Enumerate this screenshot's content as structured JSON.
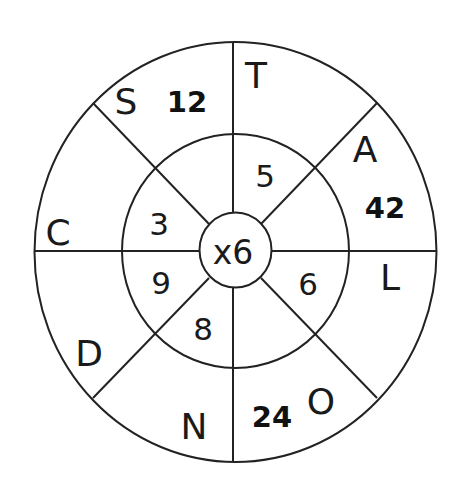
{
  "diagram": {
    "type": "multiplication-wheel",
    "center": {
      "label": "x6",
      "multiplier": 6
    },
    "colors": {
      "line": "#222222",
      "text": "#1a1a1a",
      "background": "#ffffff"
    },
    "inner_ring": [
      {
        "sector": "top-right",
        "value": "5"
      },
      {
        "sector": "right-lower",
        "value": "6"
      },
      {
        "sector": "bottom-left",
        "value": "8"
      },
      {
        "sector": "left-lower",
        "value": "9"
      },
      {
        "sector": "left-upper",
        "value": "3"
      }
    ],
    "outer_ring": [
      {
        "sector": "top-left",
        "letter": "S",
        "answer": "12"
      },
      {
        "sector": "top-right",
        "letter": "T",
        "answer": ""
      },
      {
        "sector": "right-upper",
        "letter": "A",
        "answer": "42"
      },
      {
        "sector": "right-lower",
        "letter": "L",
        "answer": ""
      },
      {
        "sector": "bottom-right",
        "letter": "O",
        "answer": "24"
      },
      {
        "sector": "bottom-left",
        "letter": "N",
        "answer": ""
      },
      {
        "sector": "left-lower",
        "letter": "D",
        "answer": ""
      },
      {
        "sector": "left-upper",
        "letter": "C",
        "answer": ""
      }
    ]
  },
  "labels": {
    "center": "x6",
    "inner": {
      "n5": "5",
      "n6": "6",
      "n8": "8",
      "n9": "9",
      "n3": "3"
    },
    "letters": {
      "S": "S",
      "T": "T",
      "A": "A",
      "L": "L",
      "O": "O",
      "N": "N",
      "D": "D",
      "C": "C"
    },
    "answers": {
      "a12": "12",
      "a42": "42",
      "a24": "24"
    }
  }
}
